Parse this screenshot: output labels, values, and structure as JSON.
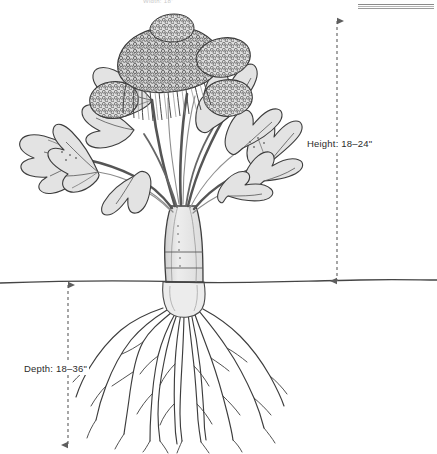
{
  "figure": {
    "top_caption": "Width: 18\"",
    "soil_line_label": "soil-line",
    "colors": {
      "ink": "#3a3a3a",
      "leaf_fill": "#e3e3e3",
      "stem_fill": "#e9e9e9",
      "floret_fill": "#d2d2d2",
      "dimension_line": "#6b6b6b",
      "soil_line": "#444444",
      "background": "#ffffff"
    }
  },
  "dimensions": {
    "height": {
      "label": "Height: 18–24\"",
      "measure": "height",
      "min_inches": 18,
      "max_inches": 24,
      "unit": "inches",
      "side": "right"
    },
    "depth": {
      "label": "Depth: 18–36\"",
      "measure": "depth",
      "min_inches": 18,
      "max_inches": 36,
      "unit": "inches",
      "side": "left"
    }
  },
  "scale_bar": {
    "name": "scale-bar",
    "visible": true
  },
  "plant_parts": {
    "head": "broccoli-floret-head",
    "leaves": "leaves",
    "stem": "main-stem",
    "roots": "fibrous-root-system"
  }
}
